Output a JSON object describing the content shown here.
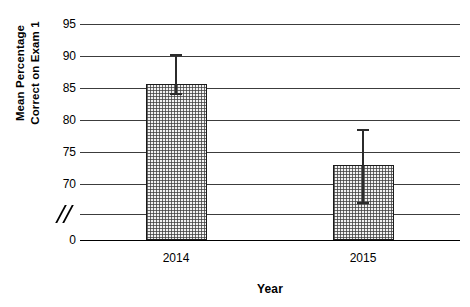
{
  "chart_data": {
    "type": "bar",
    "title": "",
    "xlabel": "Year",
    "ylabel_line1": "Mean Percentage",
    "ylabel_line2": "Correct on Exam 1",
    "categories": [
      "2014",
      "2015"
    ],
    "values": [
      85.7,
      72.9
    ],
    "errors_upper": [
      90.3,
      78.6
    ],
    "errors_lower": [
      84.2,
      67.2
    ],
    "error_plus": [
      4.6,
      5.7
    ],
    "error_minus": [
      1.5,
      5.7
    ],
    "ytick_labels": [
      "95",
      "90",
      "85",
      "80",
      "75",
      "70",
      "axis-break",
      "0"
    ],
    "ytick_values": [
      95,
      90,
      85,
      80,
      75,
      70,
      null,
      0
    ],
    "ylim": [
      0,
      95
    ],
    "axis_break": true,
    "axis_break_symbol": "//",
    "grid": true,
    "legend": "none",
    "bar_fill": "stippled-checker",
    "bar_edge_color": "#1a1a1a",
    "gridline_color": "#3c3c3c"
  }
}
